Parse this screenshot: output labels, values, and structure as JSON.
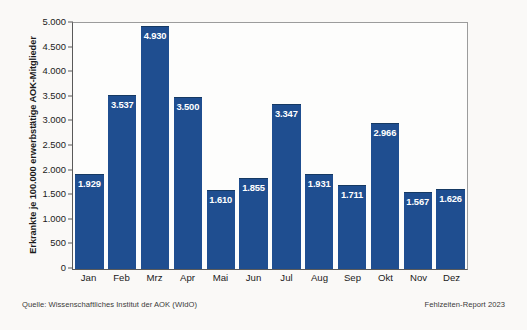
{
  "chart_data": {
    "type": "bar",
    "title": "",
    "subtitle": "",
    "xlabel": "",
    "ylabel": "Erkrankte je 100.000 erwerbstätige AOK-Mitglieder",
    "categories": [
      "Jan",
      "Feb",
      "Mrz",
      "Apr",
      "Mai",
      "Jun",
      "Jul",
      "Aug",
      "Sep",
      "Okt",
      "Nov",
      "Dez"
    ],
    "values": [
      1929,
      3537,
      4930,
      3500,
      1610,
      1855,
      3347,
      1931,
      1711,
      2966,
      1567,
      1626
    ],
    "value_labels": [
      "1.929",
      "3.537",
      "4.930",
      "3.500",
      "1.610",
      "1.855",
      "3.347",
      "1.931",
      "1.711",
      "2.966",
      "1.567",
      "1.626"
    ],
    "ylim": [
      0,
      5000
    ],
    "yticks": [
      0,
      500,
      1000,
      1500,
      2000,
      2500,
      3000,
      3500,
      4000,
      4500,
      5000
    ],
    "ytick_labels": [
      "0",
      "500",
      "1.000",
      "1.500",
      "2.000",
      "2.500",
      "3.000",
      "3.500",
      "4.000",
      "4.500",
      "5.000"
    ],
    "grid": false,
    "legend": false,
    "bar_color": "#1f4e90",
    "bar_edge_color": "#153963",
    "value_label_color": "#ffffff",
    "axis_color": "#5a5a5a"
  },
  "footer": {
    "source": "Quelle: Wissenschaftliches Institut der AOK (WIdO)",
    "report": "Fehlzeiten-Report 2023"
  }
}
